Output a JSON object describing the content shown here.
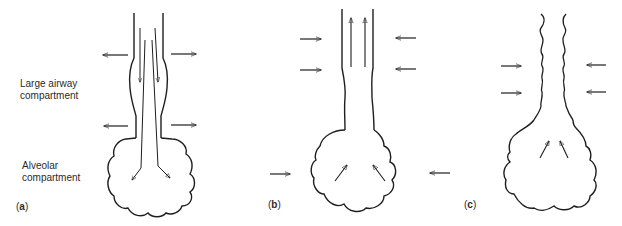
{
  "figure": {
    "labels": {
      "large_airway": [
        "Large airway",
        "compartment"
      ],
      "alveolar": [
        "Alveolar",
        "compartment"
      ]
    },
    "panels": [
      {
        "id": "a",
        "letter": "a",
        "airflow_direction": "inward (toward alveoli)",
        "pressure_arrows": "outward",
        "airway_shape": "dilated"
      },
      {
        "id": "b",
        "letter": "b",
        "airflow_direction": "outward (from alveoli)",
        "pressure_arrows": "inward",
        "airway_shape": "slightly narrowed"
      },
      {
        "id": "c",
        "letter": "c",
        "airflow_direction": "outward, limited",
        "pressure_arrows": "inward",
        "airway_shape": "collapsed / wavy"
      }
    ]
  },
  "colors": {
    "stroke": "#1e1e1e",
    "text": "#2b2b2b",
    "background": "#ffffff"
  }
}
